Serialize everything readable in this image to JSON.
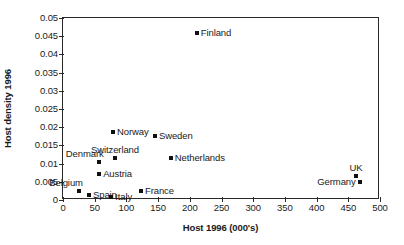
{
  "chart_data": {
    "type": "scatter",
    "title": "",
    "xlabel": "Host 1996 (000's)",
    "ylabel": "Host density 1996",
    "xlim": [
      0,
      500
    ],
    "ylim": [
      0,
      0.05
    ],
    "grid": false,
    "legend": "none",
    "xticks": [
      "0",
      "50",
      "100",
      "150",
      "200",
      "250",
      "300",
      "350",
      "400",
      "450",
      "500"
    ],
    "xtick_values": [
      0,
      50,
      100,
      150,
      200,
      250,
      300,
      350,
      400,
      450,
      500
    ],
    "yticks": [
      "0",
      "0.005",
      "0.01",
      "0.015",
      "0.02",
      "0.025",
      "0.03",
      "0.035",
      "0.04",
      "0.045",
      "0.05"
    ],
    "ytick_values": [
      0,
      0.005,
      0.01,
      0.015,
      0.02,
      0.025,
      0.03,
      0.035,
      0.04,
      0.045,
      0.05
    ],
    "marker_color": "#111111",
    "points": [
      {
        "label": "Finland",
        "x": 211,
        "y": 0.0459,
        "label_pos": "right"
      },
      {
        "label": "Norway",
        "x": 79,
        "y": 0.0187,
        "label_pos": "right"
      },
      {
        "label": "Sweden",
        "x": 145,
        "y": 0.0176,
        "label_pos": "right"
      },
      {
        "label": "Switzerland",
        "x": 82,
        "y": 0.0115,
        "label_pos": "above"
      },
      {
        "label": "Netherlands",
        "x": 170,
        "y": 0.0115,
        "label_pos": "right"
      },
      {
        "label": "Denmark",
        "x": 57,
        "y": 0.0104,
        "label_pos": "above-left"
      },
      {
        "label": "Austria",
        "x": 57,
        "y": 0.0071,
        "label_pos": "right"
      },
      {
        "label": "UK",
        "x": 462,
        "y": 0.0066,
        "label_pos": "above"
      },
      {
        "label": "Germany",
        "x": 468,
        "y": 0.0049,
        "label_pos": "left"
      },
      {
        "label": "Belgium",
        "x": 25,
        "y": 0.0025,
        "label_pos": "above-left"
      },
      {
        "label": "France",
        "x": 123,
        "y": 0.0025,
        "label_pos": "right"
      },
      {
        "label": "Spain",
        "x": 41,
        "y": 0.0014,
        "label_pos": "right"
      },
      {
        "label": "Italy",
        "x": 76,
        "y": 0.0008,
        "label_pos": "right"
      }
    ]
  }
}
